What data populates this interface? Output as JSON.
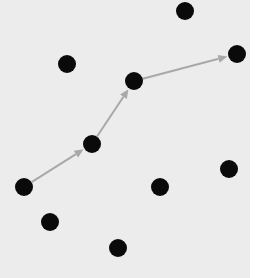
{
  "diagram": {
    "type": "node-graph",
    "background": {
      "color": "#ececec",
      "x": 0,
      "y": 0,
      "width": 250,
      "height": 278
    },
    "node_style": {
      "color": "#0a0a0a",
      "radius": 9
    },
    "edge_style": {
      "color": "#a8a8a8",
      "width": 2,
      "directed": true
    },
    "nodes": [
      {
        "id": "n1",
        "x": 185,
        "y": 11
      },
      {
        "id": "n2",
        "x": 67,
        "y": 64
      },
      {
        "id": "n3",
        "x": 237,
        "y": 54
      },
      {
        "id": "n4",
        "x": 134,
        "y": 81
      },
      {
        "id": "n5",
        "x": 92,
        "y": 144
      },
      {
        "id": "n6",
        "x": 24,
        "y": 187
      },
      {
        "id": "n7",
        "x": 229,
        "y": 169
      },
      {
        "id": "n8",
        "x": 160,
        "y": 187
      },
      {
        "id": "n9",
        "x": 50,
        "y": 222
      },
      {
        "id": "n10",
        "x": 118,
        "y": 248
      }
    ],
    "edges": [
      {
        "from": "n6",
        "to": "n5"
      },
      {
        "from": "n5",
        "to": "n4"
      },
      {
        "from": "n4",
        "to": "n3"
      }
    ]
  }
}
